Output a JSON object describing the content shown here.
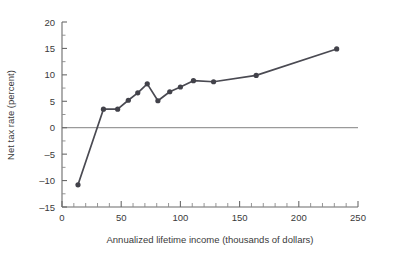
{
  "chart_data": {
    "type": "line",
    "title": "",
    "xlabel": "Annualized lifetime income (thousands of dollars)",
    "ylabel": "Net tax rate (percent)",
    "xlim": [
      0,
      250
    ],
    "ylim": [
      -15,
      20
    ],
    "xticks": [
      0,
      50,
      100,
      150,
      200,
      250
    ],
    "xtick_labels": [
      "0",
      "50",
      "100",
      "150",
      "200",
      "250"
    ],
    "xticks_minor_step": 10,
    "yticks": [
      -15,
      -10,
      -5,
      0,
      5,
      10,
      15,
      20
    ],
    "ytick_labels": [
      "-15",
      "-10",
      "-5",
      "0",
      "5",
      "10",
      "15",
      "20"
    ],
    "yticks_minor_step": 2.5,
    "grid": false,
    "legend": "none",
    "zero_line": 0,
    "marker": "circle",
    "series": [
      {
        "name": "Net tax rate",
        "color": "#42424a",
        "x": [
          13.5,
          35,
          47,
          56,
          64,
          72,
          81,
          91,
          100,
          111,
          128,
          164,
          232
        ],
        "values": [
          -10.8,
          3.5,
          3.5,
          5.2,
          6.6,
          8.3,
          5.1,
          6.8,
          7.7,
          8.9,
          8.7,
          9.9,
          14.9
        ]
      }
    ]
  },
  "axis_labels": {
    "x_title": "Annualized lifetime income (thousands of dollars)",
    "y_title": "Net tax rate (percent)"
  },
  "colors": {
    "series": "#42424a",
    "axis": "#6b6b6b",
    "zero_line": "#9a9a9a",
    "text": "#3a3a3a",
    "background": "#ffffff"
  }
}
